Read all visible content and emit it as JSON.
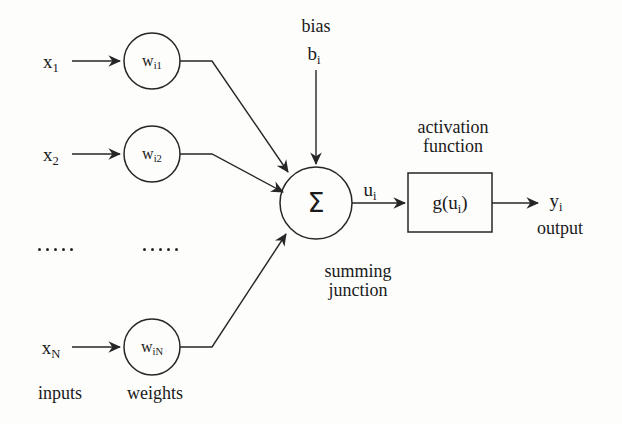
{
  "diagram": {
    "type": "neural-network-neuron",
    "stroke_color": "#262626",
    "background_color": "#fdfdfc",
    "inputs": [
      {
        "id": "x1",
        "base": "x",
        "sub": "1",
        "label": "x₁"
      },
      {
        "id": "x2",
        "base": "x",
        "sub": "2",
        "label": "x₂"
      },
      {
        "id": "xN",
        "base": "x",
        "sub": "N",
        "label": "xₙ"
      }
    ],
    "weights": [
      {
        "id": "wi1",
        "base": "w",
        "sub": "i1",
        "label": "wᵢ₁"
      },
      {
        "id": "wi2",
        "base": "w",
        "sub": "i2",
        "label": "wᵢ₂"
      },
      {
        "id": "wiN",
        "base": "w",
        "sub": "iN",
        "label": "wᵢₙ"
      }
    ],
    "bias": {
      "caption": "bias",
      "symbol_base": "b",
      "symbol_sub": "i"
    },
    "summing_junction": {
      "symbol": "Σ",
      "caption_line1": "summing",
      "caption_line2": "junction"
    },
    "net_input": {
      "base": "u",
      "sub": "i"
    },
    "activation": {
      "caption_line1": "activation",
      "caption_line2": "function",
      "box_label_prefix": "g(u",
      "box_label_sub": "i",
      "box_label_suffix": ")"
    },
    "output": {
      "base": "y",
      "sub": "i",
      "caption": "output"
    },
    "group_labels": {
      "inputs": "inputs",
      "weights": "weights"
    },
    "ellipsis": {
      "dot_count": 5,
      "glyph": "·"
    }
  }
}
